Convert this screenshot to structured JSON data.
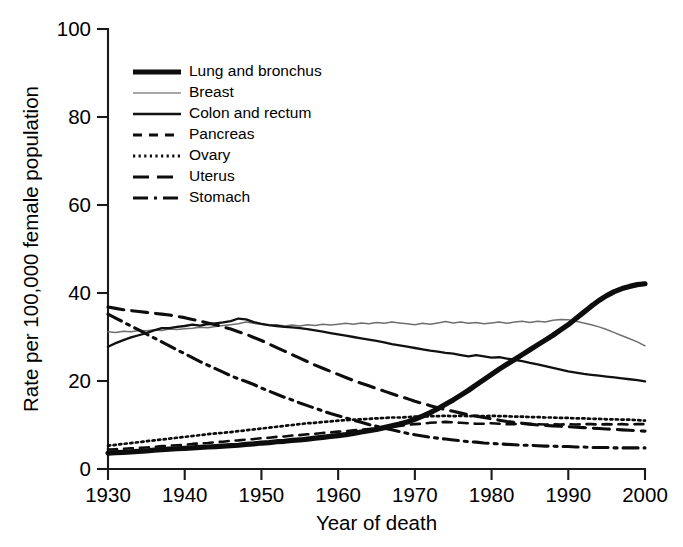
{
  "chart_data": {
    "type": "line",
    "title": "",
    "xlabel": "Year of death",
    "ylabel": "Rate per 100,000 female population",
    "xlim": [
      1930,
      2000
    ],
    "ylim": [
      0,
      100
    ],
    "xticks": [
      1930,
      1940,
      1950,
      1960,
      1970,
      1980,
      1990,
      2000
    ],
    "yticks": [
      0,
      20,
      40,
      60,
      80,
      100
    ],
    "xtick_labels": [
      "1930",
      "1940",
      "1950",
      "1960",
      "1970",
      "1980",
      "1990",
      "2000"
    ],
    "ytick_labels": [
      "0",
      "20",
      "40",
      "60",
      "80",
      "100"
    ],
    "grid": false,
    "legend_position": "upper-left-inside",
    "x": [
      1930,
      1931,
      1932,
      1933,
      1934,
      1935,
      1936,
      1937,
      1938,
      1939,
      1940,
      1941,
      1942,
      1943,
      1944,
      1945,
      1946,
      1947,
      1948,
      1949,
      1950,
      1951,
      1952,
      1953,
      1954,
      1955,
      1956,
      1957,
      1958,
      1959,
      1960,
      1961,
      1962,
      1963,
      1964,
      1965,
      1966,
      1967,
      1968,
      1969,
      1970,
      1971,
      1972,
      1973,
      1974,
      1975,
      1976,
      1977,
      1978,
      1979,
      1980,
      1981,
      1982,
      1983,
      1984,
      1985,
      1986,
      1987,
      1988,
      1989,
      1990,
      1991,
      1992,
      1993,
      1994,
      1995,
      1996,
      1997,
      1998,
      1999,
      2000
    ],
    "series": [
      {
        "name": "Lung and bronchus",
        "style": "thick-solid",
        "color": "#0d0d0d",
        "values": [
          3.6,
          3.7,
          3.8,
          3.9,
          4.0,
          4.1,
          4.3,
          4.4,
          4.5,
          4.6,
          4.7,
          4.8,
          4.9,
          5.0,
          5.1,
          5.2,
          5.3,
          5.4,
          5.6,
          5.7,
          5.9,
          6.0,
          6.2,
          6.3,
          6.5,
          6.6,
          6.8,
          7.0,
          7.2,
          7.4,
          7.6,
          7.8,
          8.1,
          8.4,
          8.7,
          9.0,
          9.4,
          9.8,
          10.2,
          10.7,
          11.3,
          12.0,
          12.8,
          13.7,
          14.7,
          15.7,
          16.8,
          17.9,
          19.1,
          20.3,
          21.5,
          22.7,
          23.8,
          24.9,
          26.0,
          27.1,
          28.2,
          29.3,
          30.4,
          31.6,
          32.8,
          34.2,
          35.6,
          37.0,
          38.3,
          39.4,
          40.3,
          41.0,
          41.5,
          41.9,
          42.1
        ]
      },
      {
        "name": "Breast",
        "style": "thin-grey-solid",
        "color": "#6f6f6f",
        "values": [
          31.2,
          31.0,
          31.3,
          31.2,
          31.5,
          31.4,
          31.6,
          31.5,
          31.8,
          31.7,
          31.9,
          32.0,
          32.2,
          32.1,
          32.4,
          32.6,
          32.8,
          33.0,
          33.4,
          33.1,
          32.9,
          32.6,
          32.8,
          32.5,
          32.7,
          32.5,
          32.8,
          32.6,
          32.9,
          32.7,
          32.9,
          33.1,
          32.9,
          33.2,
          33.0,
          33.3,
          33.1,
          33.4,
          33.2,
          33.0,
          32.8,
          33.1,
          32.9,
          33.2,
          33.5,
          33.2,
          33.4,
          33.1,
          33.3,
          33.0,
          33.2,
          33.4,
          33.1,
          33.4,
          33.6,
          33.3,
          33.6,
          33.4,
          33.8,
          34.0,
          33.9,
          33.6,
          33.2,
          32.8,
          32.3,
          31.7,
          31.0,
          30.3,
          29.6,
          28.9,
          28.0
        ]
      },
      {
        "name": "Colon and rectum",
        "style": "medium-solid",
        "color": "#111111",
        "values": [
          27.8,
          28.6,
          29.3,
          29.9,
          30.4,
          30.9,
          31.5,
          32.0,
          32.0,
          32.3,
          32.5,
          32.8,
          32.6,
          32.9,
          33.1,
          33.3,
          33.6,
          34.2,
          34.0,
          33.4,
          33.0,
          32.7,
          32.5,
          32.3,
          32.2,
          32.0,
          31.8,
          31.5,
          31.2,
          30.9,
          30.6,
          30.3,
          30.0,
          29.7,
          29.4,
          29.1,
          28.8,
          28.4,
          28.1,
          27.8,
          27.5,
          27.2,
          26.9,
          26.7,
          26.4,
          26.2,
          25.9,
          25.6,
          25.9,
          25.6,
          25.3,
          25.4,
          25.1,
          24.8,
          24.5,
          24.1,
          23.8,
          23.4,
          23.0,
          22.6,
          22.2,
          21.9,
          21.6,
          21.4,
          21.2,
          21.0,
          20.8,
          20.6,
          20.4,
          20.2,
          19.9
        ]
      },
      {
        "name": "Pancreas",
        "style": "short-dash",
        "color": "#0d0d0d",
        "values": [
          4.4,
          4.5,
          4.6,
          4.7,
          4.8,
          4.9,
          5.0,
          5.2,
          5.3,
          5.4,
          5.5,
          5.7,
          5.8,
          5.9,
          6.1,
          6.2,
          6.4,
          6.5,
          6.7,
          6.8,
          7.0,
          7.1,
          7.3,
          7.4,
          7.6,
          7.7,
          7.9,
          8.0,
          8.2,
          8.3,
          8.5,
          8.6,
          8.8,
          8.9,
          9.1,
          9.2,
          9.4,
          9.6,
          9.8,
          10.0,
          10.2,
          10.3,
          10.5,
          10.6,
          10.7,
          10.6,
          10.5,
          10.4,
          10.3,
          10.3,
          10.4,
          10.3,
          10.2,
          10.2,
          10.3,
          10.2,
          10.2,
          10.1,
          10.2,
          10.1,
          10.2,
          10.1,
          10.2,
          10.2,
          10.1,
          10.2,
          10.1,
          10.2,
          10.1,
          10.2,
          10.2
        ]
      },
      {
        "name": "Ovary",
        "style": "dotted",
        "color": "#0d0d0d",
        "values": [
          5.3,
          5.5,
          5.7,
          5.9,
          6.1,
          6.3,
          6.5,
          6.7,
          6.9,
          7.1,
          7.3,
          7.5,
          7.7,
          7.9,
          8.1,
          8.2,
          8.4,
          8.6,
          8.8,
          9.0,
          9.2,
          9.4,
          9.6,
          9.8,
          10.0,
          10.2,
          10.4,
          10.5,
          10.7,
          10.8,
          11.0,
          11.1,
          11.2,
          11.3,
          11.4,
          11.5,
          11.6,
          11.7,
          11.7,
          11.8,
          11.9,
          11.9,
          12.0,
          12.0,
          12.1,
          12.0,
          12.1,
          12.0,
          12.1,
          12.0,
          12.1,
          12.0,
          12.0,
          11.9,
          11.9,
          11.8,
          11.8,
          11.7,
          11.7,
          11.6,
          11.6,
          11.5,
          11.5,
          11.4,
          11.4,
          11.3,
          11.3,
          11.2,
          11.2,
          11.1,
          11.0
        ]
      },
      {
        "name": "Uterus",
        "style": "long-dash",
        "color": "#0d0d0d",
        "values": [
          36.8,
          36.5,
          36.2,
          36.0,
          35.8,
          35.6,
          35.4,
          35.2,
          35.0,
          34.7,
          34.4,
          34.0,
          33.6,
          33.2,
          32.8,
          32.3,
          31.8,
          31.2,
          30.6,
          29.9,
          29.2,
          28.4,
          27.6,
          26.8,
          26.0,
          25.2,
          24.4,
          23.6,
          22.9,
          22.2,
          21.5,
          20.8,
          20.1,
          19.5,
          18.9,
          18.3,
          17.7,
          17.1,
          16.5,
          16.0,
          15.4,
          14.9,
          14.4,
          13.9,
          13.5,
          13.1,
          12.7,
          12.3,
          12.0,
          11.7,
          11.4,
          11.1,
          10.8,
          10.6,
          10.4,
          10.2,
          10.0,
          9.9,
          9.8,
          9.7,
          9.6,
          9.5,
          9.4,
          9.3,
          9.2,
          9.1,
          9.0,
          8.9,
          8.8,
          8.7,
          8.6
        ]
      },
      {
        "name": "Stomach",
        "style": "dash-dot",
        "color": "#0d0d0d",
        "values": [
          35.2,
          34.3,
          33.4,
          32.5,
          31.6,
          30.7,
          29.8,
          28.9,
          28.0,
          27.1,
          26.2,
          25.3,
          24.4,
          23.6,
          22.8,
          22.0,
          21.2,
          20.5,
          19.9,
          19.2,
          18.4,
          17.7,
          17.0,
          16.3,
          15.7,
          15.0,
          14.4,
          13.8,
          13.2,
          12.6,
          12.1,
          11.6,
          11.1,
          10.6,
          10.1,
          9.7,
          9.3,
          8.9,
          8.5,
          8.1,
          7.8,
          7.5,
          7.2,
          7.0,
          6.8,
          6.6,
          6.4,
          6.2,
          6.1,
          5.9,
          5.8,
          5.7,
          5.6,
          5.5,
          5.4,
          5.4,
          5.3,
          5.2,
          5.2,
          5.1,
          5.1,
          5.0,
          5.0,
          4.9,
          4.9,
          4.9,
          4.8,
          4.8,
          4.8,
          4.8,
          4.8
        ]
      }
    ]
  },
  "legend": {
    "items": [
      {
        "label": "Lung and bronchus",
        "key": "lung"
      },
      {
        "label": "Breast",
        "key": "breast"
      },
      {
        "label": "Colon and rectum",
        "key": "colon"
      },
      {
        "label": "Pancreas",
        "key": "pancreas"
      },
      {
        "label": "Ovary",
        "key": "ovary"
      },
      {
        "label": "Uterus",
        "key": "uterus"
      },
      {
        "label": "Stomach",
        "key": "stomach"
      }
    ]
  }
}
